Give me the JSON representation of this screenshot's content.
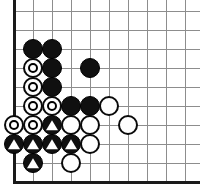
{
  "diagram": {
    "kind": "go-board-corner-diagram",
    "width": 200,
    "height": 195,
    "background_color": "#ffffff"
  },
  "board": {
    "origin_x": 14,
    "origin_y": 11,
    "spacing": 19,
    "columns": 10,
    "rows": 10,
    "grid_color": "#8d8d8d",
    "edge_color": "#1a1a1a",
    "edge_thickness": 3,
    "left_edge_is_border": true,
    "bottom_edge_is_border": true,
    "top_edge_is_border": false,
    "right_edge_is_border": false,
    "vertical_line_x": [
      14,
      33,
      52,
      71,
      90,
      109,
      128,
      147,
      166,
      185
    ],
    "horizontal_line_y": [
      11,
      30,
      49,
      68,
      87,
      106,
      125,
      144,
      163,
      182
    ]
  },
  "stone_style": {
    "diameter": 20,
    "black_color": "#101010",
    "white_color": "#fefefe",
    "white_border_color": "#0a0a0a",
    "marker_on_black_color": "#ffffff",
    "marker_on_white_color": "#000000"
  },
  "stones": [
    {
      "color": "black",
      "col": 1,
      "row": 2,
      "marker": "none",
      "label": "black-stone"
    },
    {
      "color": "black",
      "col": 2,
      "row": 2,
      "marker": "none",
      "label": "black-stone"
    },
    {
      "color": "white",
      "col": 1,
      "row": 3,
      "marker": "circle",
      "label": "white-stone-circle"
    },
    {
      "color": "black",
      "col": 2,
      "row": 3,
      "marker": "none",
      "label": "black-stone"
    },
    {
      "color": "black",
      "col": 4,
      "row": 3,
      "marker": "none",
      "label": "black-stone"
    },
    {
      "color": "white",
      "col": 1,
      "row": 4,
      "marker": "circle",
      "label": "white-stone-circle"
    },
    {
      "color": "black",
      "col": 2,
      "row": 4,
      "marker": "none",
      "label": "black-stone"
    },
    {
      "color": "white",
      "col": 1,
      "row": 5,
      "marker": "circle",
      "label": "white-stone-circle"
    },
    {
      "color": "white",
      "col": 2,
      "row": 5,
      "marker": "circle",
      "label": "white-stone-circle"
    },
    {
      "color": "black",
      "col": 3,
      "row": 5,
      "marker": "none",
      "label": "black-stone"
    },
    {
      "color": "black",
      "col": 4,
      "row": 5,
      "marker": "none",
      "label": "black-stone"
    },
    {
      "color": "white",
      "col": 5,
      "row": 5,
      "marker": "none",
      "label": "white-stone"
    },
    {
      "color": "white",
      "col": 0,
      "row": 6,
      "marker": "circle",
      "label": "white-stone-circle"
    },
    {
      "color": "white",
      "col": 1,
      "row": 6,
      "marker": "circle",
      "label": "white-stone-circle"
    },
    {
      "color": "black",
      "col": 2,
      "row": 6,
      "marker": "triangle",
      "label": "black-stone-triangle"
    },
    {
      "color": "white",
      "col": 3,
      "row": 6,
      "marker": "none",
      "label": "white-stone"
    },
    {
      "color": "white",
      "col": 4,
      "row": 6,
      "marker": "none",
      "label": "white-stone"
    },
    {
      "color": "white",
      "col": 6,
      "row": 6,
      "marker": "none",
      "label": "white-stone"
    },
    {
      "color": "black",
      "col": 0,
      "row": 7,
      "marker": "triangle",
      "label": "black-stone-triangle"
    },
    {
      "color": "black",
      "col": 1,
      "row": 7,
      "marker": "triangle",
      "label": "black-stone-triangle"
    },
    {
      "color": "black",
      "col": 2,
      "row": 7,
      "marker": "triangle",
      "label": "black-stone-triangle"
    },
    {
      "color": "black",
      "col": 3,
      "row": 7,
      "marker": "triangle",
      "label": "black-stone-triangle"
    },
    {
      "color": "white",
      "col": 4,
      "row": 7,
      "marker": "none",
      "label": "white-stone"
    },
    {
      "color": "black",
      "col": 1,
      "row": 8,
      "marker": "triangle",
      "label": "black-stone-triangle"
    },
    {
      "color": "white",
      "col": 3,
      "row": 8,
      "marker": "none",
      "label": "white-stone"
    }
  ]
}
